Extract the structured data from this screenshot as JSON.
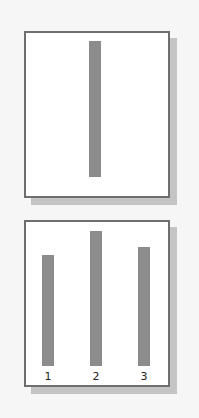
{
  "panels": [
    {
      "name": "single-bar-panel",
      "bars": [
        {
          "label": "",
          "relative_height": 1.0
        }
      ]
    },
    {
      "name": "three-bar-panel",
      "bars": [
        {
          "label": "1",
          "relative_height": 0.81
        },
        {
          "label": "2",
          "relative_height": 1.0
        },
        {
          "label": "3",
          "relative_height": 0.88
        }
      ]
    }
  ],
  "colors": {
    "bar": "#8c8c8c",
    "border": "#6e6e6e",
    "shadow": "#c4c4c4",
    "background": "#f6f6f6"
  }
}
